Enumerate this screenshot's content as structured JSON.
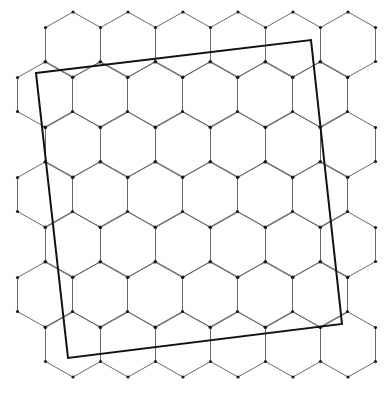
{
  "diagram": {
    "hex_grid": {
      "rows": 7,
      "cols_per_row": 6,
      "even_row_first_center_x": 73,
      "odd_row_first_center_x": 45,
      "first_row_center_y": 44.5,
      "col_spacing": 55,
      "row_spacing": 50,
      "half_width": 27.5,
      "half_side": 17,
      "peak_offset": 32.5,
      "edge_color": "#6a6a6a",
      "vertex_color": "#1a1a1a",
      "vertex_radius": 1.6
    },
    "square": {
      "corners": [
        {
          "label": "top-left",
          "x": 36,
          "y": 73
        },
        {
          "label": "top-right",
          "x": 311,
          "y": 40
        },
        {
          "label": "bottom-right",
          "x": 342,
          "y": 324
        },
        {
          "label": "bottom-left",
          "x": 68,
          "y": 358
        }
      ],
      "stroke_color": "#111111"
    }
  }
}
